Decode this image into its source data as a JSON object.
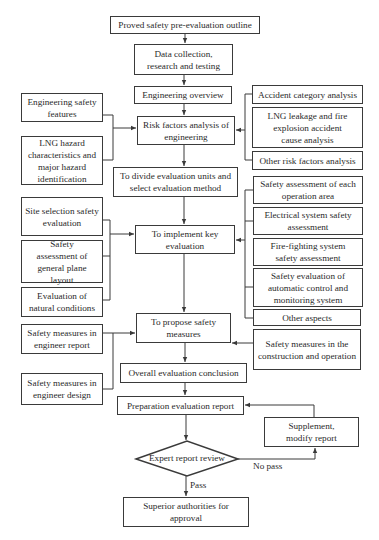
{
  "flowchart": {
    "main": {
      "outline": "Proved safety pre-evaluation outline",
      "data_collection": "Data collection, research and testing",
      "engineering_overview": "Engineering overview",
      "risk_factors": "Risk factors analysis of engineering",
      "divide_units": "To divide evaluation units and select evaluation method",
      "implement_key": "To implement key evaluation",
      "propose_measures": "To propose safety measures",
      "overall_conclusion": "Overall evaluation conclusion",
      "prep_report": "Preparation evaluation report",
      "expert_review": "Expert report review",
      "superior_approval": "Superior authorities for approval"
    },
    "left": {
      "eng_safety_features": "Engineering safety features",
      "lng_hazard": "LNG hazard characteristics and major hazard identification",
      "site_selection": "Site selection safety evaluation",
      "plane_layout": "Safety assessment of general plane layout",
      "natural_conditions": "Evaluation of natural conditions",
      "measures_report": "Safety measures in engineer report",
      "measures_design": "Safety measures in engineer design"
    },
    "right": {
      "accident_category": "Accident category analysis",
      "lng_leakage": "LNG leakage and fire explosion accident cause analysis",
      "other_risk": "Other risk factors analysis",
      "each_operation": "Safety assessment of each operation area",
      "electrical": "Electrical system safety assessment",
      "fire_fighting": "Fire-fighting system safety assessment",
      "automatic_control": "Safety evaluation of automatic control and monitoring system",
      "other_aspects": "Other aspects",
      "construction_operation": "Safety measures in the construction and operation",
      "supplement_modify": "Supplement, modify report"
    },
    "edge_labels": {
      "pass": "Pass",
      "no_pass": "No pass"
    }
  },
  "colors": {
    "stroke": "#3a3a3a",
    "text": "#2a2a2a",
    "background": "#ffffff"
  }
}
